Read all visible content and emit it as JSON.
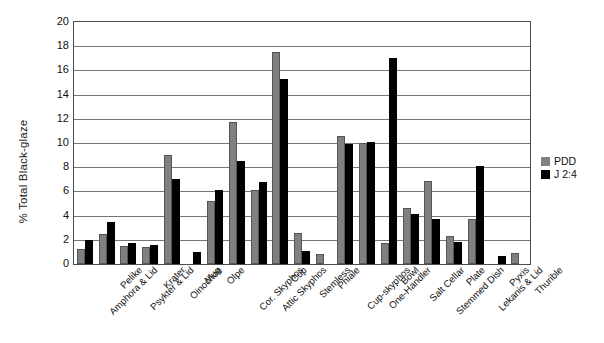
{
  "chart_data": {
    "type": "bar",
    "title": "",
    "xlabel": "",
    "ylabel": "% Total Black-glaze",
    "ylim": [
      0,
      20
    ],
    "ytick_step": 2,
    "grid": true,
    "legend_position": "right",
    "categories": [
      "Amphora & Lid",
      "Pelike",
      "Psykter & Lid",
      "Krater",
      "Oinochoe",
      "Mug",
      "Olpe",
      "Cor. Skyphos",
      "Attic Skyphos",
      "Cup",
      "Stemless",
      "Phiale",
      "Cup-skyphos",
      "One-Handler",
      "Bowl",
      "Salt Cellar",
      "Stemmed Dish",
      "Plate",
      "Lekanis & Lid",
      "Pyxis",
      "Thurible"
    ],
    "ytick_labels": [
      "0",
      "2",
      "4",
      "6",
      "8",
      "10",
      "12",
      "14",
      "16",
      "18",
      "20"
    ],
    "series": [
      {
        "name": "PDD",
        "color": "#808080",
        "values": [
          1.2,
          2.5,
          1.5,
          1.4,
          9.0,
          0.0,
          5.2,
          11.7,
          6.1,
          17.5,
          2.6,
          0.8,
          10.6,
          10.0,
          1.7,
          4.6,
          6.9,
          2.3,
          3.7,
          0.0,
          0.9
        ]
      },
      {
        "name": "J 2:4",
        "color": "#000000",
        "values": [
          2.0,
          3.5,
          1.7,
          1.6,
          7.0,
          1.0,
          6.1,
          8.5,
          6.8,
          15.3,
          1.1,
          0.0,
          9.9,
          10.1,
          17.0,
          4.1,
          3.7,
          1.8,
          8.1,
          0.7,
          0.0
        ]
      }
    ]
  },
  "legend": {
    "items": [
      {
        "label": "PDD",
        "swatch": "pdd"
      },
      {
        "label": "J 2:4",
        "swatch": "j24"
      }
    ]
  }
}
